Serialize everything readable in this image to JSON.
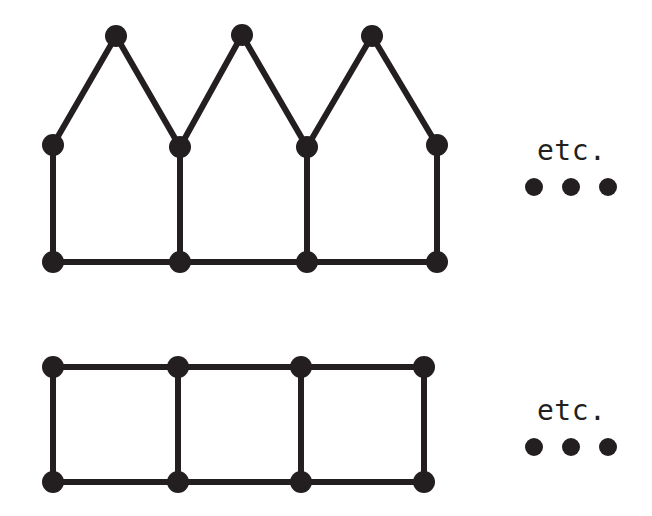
{
  "page": {
    "background_color": "#ffffff",
    "ink_color": "#231f20",
    "width": 652,
    "height": 516
  },
  "figures": [
    {
      "id": "top-figure",
      "name": "fan-triangulated-strip-graph",
      "description": "Graph strip with triangular peaks on top and square cells below",
      "etc_label": "etc.",
      "node_radius": 11,
      "edge_width": 6,
      "nodes": [
        {
          "id": "t-apex-1",
          "x": 116,
          "y": 36
        },
        {
          "id": "t-apex-2",
          "x": 242,
          "y": 35
        },
        {
          "id": "t-apex-3",
          "x": 372,
          "y": 36
        },
        {
          "id": "t-mid-1",
          "x": 53,
          "y": 145
        },
        {
          "id": "t-mid-2",
          "x": 180,
          "y": 147
        },
        {
          "id": "t-mid-3",
          "x": 307,
          "y": 147
        },
        {
          "id": "t-mid-4",
          "x": 437,
          "y": 145
        },
        {
          "id": "t-bot-1",
          "x": 53,
          "y": 262
        },
        {
          "id": "t-bot-2",
          "x": 180,
          "y": 262
        },
        {
          "id": "t-bot-3",
          "x": 307,
          "y": 262
        },
        {
          "id": "t-bot-4",
          "x": 437,
          "y": 262
        }
      ],
      "edges": [
        {
          "from": "t-mid-1",
          "to": "t-apex-1"
        },
        {
          "from": "t-apex-1",
          "to": "t-mid-2"
        },
        {
          "from": "t-mid-2",
          "to": "t-apex-2"
        },
        {
          "from": "t-apex-2",
          "to": "t-mid-3"
        },
        {
          "from": "t-mid-3",
          "to": "t-apex-3"
        },
        {
          "from": "t-apex-3",
          "to": "t-mid-4"
        },
        {
          "from": "t-mid-1",
          "to": "t-bot-1"
        },
        {
          "from": "t-mid-2",
          "to": "t-bot-2"
        },
        {
          "from": "t-mid-3",
          "to": "t-bot-3"
        },
        {
          "from": "t-mid-4",
          "to": "t-bot-4"
        },
        {
          "from": "t-bot-1",
          "to": "t-bot-2"
        },
        {
          "from": "t-bot-2",
          "to": "t-bot-3"
        },
        {
          "from": "t-bot-3",
          "to": "t-bot-4"
        }
      ],
      "continuation_dots": [
        {
          "x": 534,
          "y": 187,
          "r": 9
        },
        {
          "x": 571,
          "y": 187,
          "r": 9
        },
        {
          "x": 608,
          "y": 187,
          "r": 9
        }
      ]
    },
    {
      "id": "bottom-figure",
      "name": "ladder-grid-strip-graph",
      "description": "Ladder graph of three square cells in a row",
      "etc_label": "etc.",
      "node_radius": 11,
      "edge_width": 6,
      "nodes": [
        {
          "id": "b-top-1",
          "x": 53,
          "y": 367
        },
        {
          "id": "b-top-2",
          "x": 178,
          "y": 367
        },
        {
          "id": "b-top-3",
          "x": 301,
          "y": 367
        },
        {
          "id": "b-top-4",
          "x": 424,
          "y": 367
        },
        {
          "id": "b-bot-1",
          "x": 53,
          "y": 482
        },
        {
          "id": "b-bot-2",
          "x": 178,
          "y": 482
        },
        {
          "id": "b-bot-3",
          "x": 301,
          "y": 482
        },
        {
          "id": "b-bot-4",
          "x": 424,
          "y": 482
        }
      ],
      "edges": [
        {
          "from": "b-top-1",
          "to": "b-top-2"
        },
        {
          "from": "b-top-2",
          "to": "b-top-3"
        },
        {
          "from": "b-top-3",
          "to": "b-top-4"
        },
        {
          "from": "b-bot-1",
          "to": "b-bot-2"
        },
        {
          "from": "b-bot-2",
          "to": "b-bot-3"
        },
        {
          "from": "b-bot-3",
          "to": "b-bot-4"
        },
        {
          "from": "b-top-1",
          "to": "b-bot-1"
        },
        {
          "from": "b-top-2",
          "to": "b-bot-2"
        },
        {
          "from": "b-top-3",
          "to": "b-bot-3"
        },
        {
          "from": "b-top-4",
          "to": "b-bot-4"
        }
      ],
      "continuation_dots": [
        {
          "x": 534,
          "y": 447,
          "r": 9
        },
        {
          "x": 571,
          "y": 447,
          "r": 9
        },
        {
          "x": 608,
          "y": 447,
          "r": 9
        }
      ]
    }
  ]
}
